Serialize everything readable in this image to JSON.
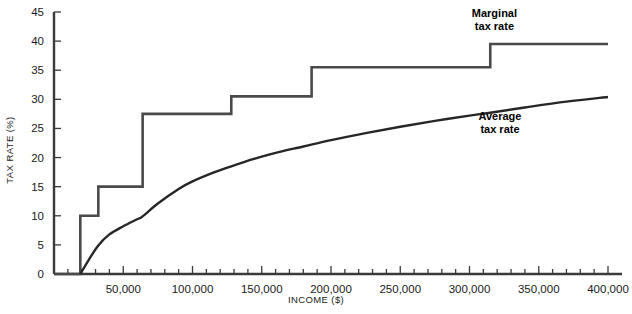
{
  "chart_data": {
    "type": "line",
    "title": "",
    "xlabel": "INCOME ($)",
    "ylabel": "TAX RATE (%)",
    "xlim": [
      0,
      400000
    ],
    "ylim": [
      0,
      45
    ],
    "grid": false,
    "legend_position": "inline-right",
    "x_ticks": [
      {
        "value": 50000,
        "label": "50,000"
      },
      {
        "value": 100000,
        "label": "100,000"
      },
      {
        "value": 150000,
        "label": "150,000"
      },
      {
        "value": 200000,
        "label": "200,000"
      },
      {
        "value": 250000,
        "label": "250,000"
      },
      {
        "value": 300000,
        "label": "300,000"
      },
      {
        "value": 350000,
        "label": "350,000"
      },
      {
        "value": 400000,
        "label": "400,000"
      }
    ],
    "x_minor_tick_interval": 10000,
    "y_ticks": [
      {
        "value": 0,
        "label": "0"
      },
      {
        "value": 5,
        "label": "5"
      },
      {
        "value": 10,
        "label": "10"
      },
      {
        "value": 15,
        "label": "15"
      },
      {
        "value": 20,
        "label": "20"
      },
      {
        "value": 25,
        "label": "25"
      },
      {
        "value": 30,
        "label": "30"
      },
      {
        "value": 35,
        "label": "35"
      },
      {
        "value": 40,
        "label": "40"
      },
      {
        "value": 45,
        "label": "45"
      }
    ],
    "series": [
      {
        "name": "Marginal tax rate",
        "label_line1": "Marginal",
        "label_line2": "tax rate",
        "label_x": 318000,
        "label_y": 44.2,
        "style": "step",
        "color": "#4a4a4a",
        "width": 2.6,
        "points": [
          {
            "x": 0,
            "y": 0
          },
          {
            "x": 19000,
            "y": 0
          },
          {
            "x": 19000,
            "y": 10
          },
          {
            "x": 32000,
            "y": 10
          },
          {
            "x": 32000,
            "y": 15
          },
          {
            "x": 64000,
            "y": 15
          },
          {
            "x": 64000,
            "y": 27.5
          },
          {
            "x": 128000,
            "y": 27.5
          },
          {
            "x": 128000,
            "y": 30.5
          },
          {
            "x": 186000,
            "y": 30.5
          },
          {
            "x": 186000,
            "y": 35.5
          },
          {
            "x": 315000,
            "y": 35.5
          },
          {
            "x": 315000,
            "y": 39.5
          },
          {
            "x": 400000,
            "y": 39.5
          }
        ]
      },
      {
        "name": "Average tax rate",
        "label_line1": "Average",
        "label_line2": "tax rate",
        "label_x": 322000,
        "label_y": 26.5,
        "style": "curve",
        "color": "#262626",
        "width": 2.4,
        "points": [
          {
            "x": 19000,
            "y": 0
          },
          {
            "x": 25000,
            "y": 2.4
          },
          {
            "x": 32000,
            "y": 4.9
          },
          {
            "x": 40000,
            "y": 6.8
          },
          {
            "x": 50000,
            "y": 8.2
          },
          {
            "x": 60000,
            "y": 9.4
          },
          {
            "x": 64000,
            "y": 9.9
          },
          {
            "x": 75000,
            "y": 12.1
          },
          {
            "x": 90000,
            "y": 14.6
          },
          {
            "x": 100000,
            "y": 15.9
          },
          {
            "x": 115000,
            "y": 17.4
          },
          {
            "x": 128000,
            "y": 18.5
          },
          {
            "x": 145000,
            "y": 19.8
          },
          {
            "x": 160000,
            "y": 20.8
          },
          {
            "x": 180000,
            "y": 21.9
          },
          {
            "x": 200000,
            "y": 23.0
          },
          {
            "x": 225000,
            "y": 24.2
          },
          {
            "x": 250000,
            "y": 25.3
          },
          {
            "x": 275000,
            "y": 26.3
          },
          {
            "x": 300000,
            "y": 27.2
          },
          {
            "x": 315000,
            "y": 27.7
          },
          {
            "x": 340000,
            "y": 28.6
          },
          {
            "x": 370000,
            "y": 29.6
          },
          {
            "x": 400000,
            "y": 30.4
          }
        ]
      }
    ],
    "axis_color": "#3a3a3a",
    "text_color": "#1a1a1a"
  }
}
